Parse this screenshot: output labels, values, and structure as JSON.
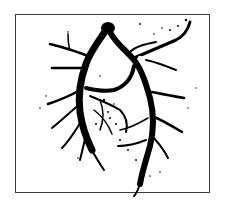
{
  "image": {
    "description": "Black silhouette of a branching vascular / bronchial tree cast, inside a thin dark rectangular frame on white background",
    "colors": {
      "background": "#ffffff",
      "frame": "#3a3a3a",
      "silhouette": "#000000"
    }
  }
}
